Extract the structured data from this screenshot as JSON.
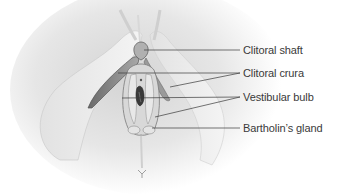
{
  "diagram": {
    "labels": [
      {
        "text": "Clitoral shaft"
      },
      {
        "text": "Clitoral crura"
      },
      {
        "text": "Vestibular bulb"
      },
      {
        "text": "Bartholin’s gland"
      }
    ]
  }
}
